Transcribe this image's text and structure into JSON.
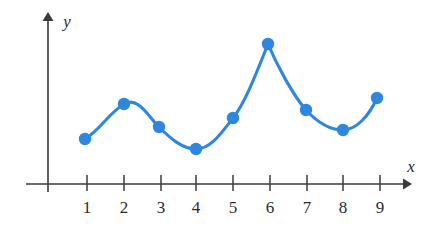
{
  "figure": {
    "name": "coordinate-plane-scatter-with-smooth-curve",
    "background_color": "#ffffff",
    "axis_color": "#3a3a3a",
    "accent_color": "#2e86de"
  },
  "axes": {
    "x_axis_label": "x",
    "y_axis_label": "y",
    "x_tick_labels": [
      "1",
      "2",
      "3",
      "4",
      "5",
      "6",
      "7",
      "8",
      "9"
    ],
    "y_tick_labels": [],
    "x_axis_has_arrow": true,
    "y_axis_has_arrow": true,
    "grid": false
  },
  "chart_data": {
    "type": "line",
    "title": "",
    "subtitle": "",
    "xlabel": "x",
    "ylabel": "y",
    "x": [
      1,
      2,
      3,
      4,
      5,
      6,
      7,
      8,
      9
    ],
    "values": [
      4.5,
      8.0,
      5.7,
      3.5,
      6.6,
      14.0,
      7.4,
      5.4,
      8.6
    ],
    "series": [
      {
        "name": "curve",
        "values": [
          4.5,
          8.0,
          5.7,
          3.5,
          6.6,
          14.0,
          7.4,
          5.4,
          8.6
        ],
        "color": "#2e86de",
        "marker": "circle",
        "interpolation": "smooth-with-cusp-at-x6"
      }
    ],
    "categories": [
      "1",
      "2",
      "3",
      "4",
      "5",
      "6",
      "7",
      "8",
      "9"
    ],
    "xlim": [
      0,
      9.8
    ],
    "ylim": [
      0,
      15
    ],
    "grid": false,
    "legend": "none",
    "annotations": []
  },
  "pixels": {
    "origin_x": 48,
    "axis_y": 184,
    "x_spacing": 37,
    "unit_y": 10,
    "tick_x": [
      87,
      124,
      161,
      196,
      233,
      270,
      307,
      343,
      380
    ],
    "tick_top": 175,
    "tick_bottom": 191,
    "label_y": 211,
    "point_radius": 6.2,
    "curve_width": 3.1,
    "points": [
      [
        85,
        139
      ],
      [
        124,
        104
      ],
      [
        159,
        127
      ],
      [
        196,
        149
      ],
      [
        233,
        118
      ],
      [
        268,
        44
      ],
      [
        306,
        110
      ],
      [
        343,
        130
      ],
      [
        377,
        98
      ]
    ],
    "curve_path": "M 85 139 C 99 131 110 112 124 104 C 138 96 148 116 159 127 C 170 138 182 149 196 149 C 211 149 222 132 233 118 C 245 103 256 74 268 44 C 276 63 292 94 306 110 C 318 123 330 130 343 130 C 356 130 369 116 377 98",
    "y_axis_top": 14,
    "y_axis_bottom": 192,
    "x_axis_left": 26,
    "x_axis_right": 408,
    "x_label_pos": [
      411,
      171
    ],
    "y_label_pos": [
      66,
      25
    ]
  }
}
